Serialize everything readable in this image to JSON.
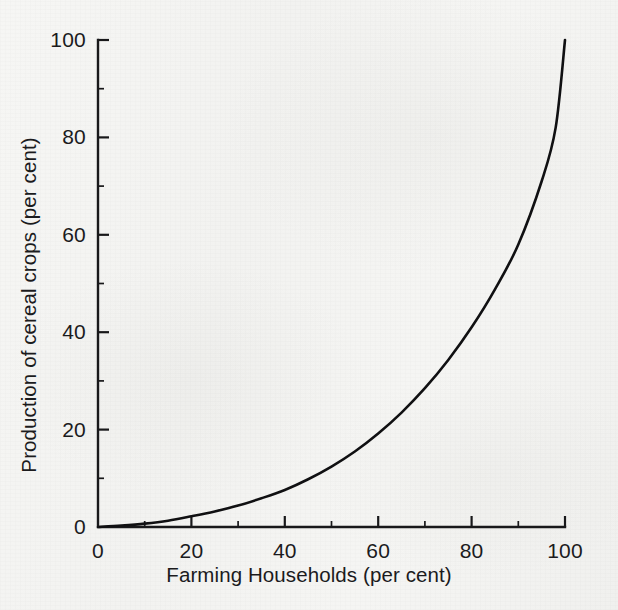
{
  "figure": {
    "background_color": "#f3f3f1",
    "ink_color": "#18181a"
  },
  "chart_data": {
    "type": "line",
    "title": "",
    "subtitle": "",
    "xlabel": "Farming Households (per cent)",
    "ylabel": "Production of cereal crops (per cent)",
    "xlim": [
      0,
      100
    ],
    "ylim": [
      0,
      100
    ],
    "grid": false,
    "legend": "none",
    "x_ticks": [
      0,
      20,
      40,
      60,
      80,
      100
    ],
    "y_ticks": [
      0,
      20,
      40,
      60,
      80,
      100
    ],
    "x_tick_labels": [
      "0",
      "20",
      "40",
      "60",
      "80",
      "100"
    ],
    "y_tick_labels": [
      "0",
      "20",
      "40",
      "60",
      "80",
      "100"
    ],
    "x_minor_ticks": [
      10,
      30,
      50,
      70,
      90
    ],
    "y_minor_ticks": [
      10,
      30,
      50,
      70,
      90
    ],
    "tick_direction": "in",
    "axes_spines": [
      "left",
      "bottom"
    ],
    "annotations": [],
    "series": [
      {
        "name": "Concentration of cereal production",
        "color": "#101012",
        "line_width": 2.6,
        "x": [
          0,
          5,
          10,
          15,
          20,
          25,
          30,
          35,
          40,
          45,
          50,
          55,
          60,
          65,
          70,
          75,
          80,
          85,
          90,
          95,
          98,
          100
        ],
        "y": [
          0,
          0.3,
          0.7,
          1.3,
          2.2,
          3.2,
          4.4,
          5.9,
          7.6,
          9.8,
          12.4,
          15.5,
          19.2,
          23.5,
          28.5,
          34.3,
          41.0,
          48.8,
          58.0,
          71.0,
          82.0,
          100.0
        ]
      }
    ]
  },
  "axis_geometry": {
    "plot_left_px": 98,
    "plot_right_px": 565,
    "plot_top_px": 40,
    "plot_bottom_px": 527
  }
}
